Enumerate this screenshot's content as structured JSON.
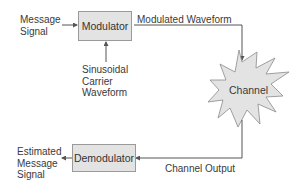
{
  "diagram": {
    "type": "block-diagram",
    "nodes": {
      "modulator": {
        "label": "Modulator"
      },
      "channel": {
        "label": "Channel"
      },
      "demodulator": {
        "label": "Demodulator"
      }
    },
    "labels": {
      "message_signal": "Message\nSignal",
      "carrier": "Sinusoidal\nCarrier\nWaveform",
      "modulated_waveform": "Modulated Waveform",
      "channel_output": "Channel Output",
      "estimated_message": "Estimated\nMessage\nSignal"
    },
    "edges": [
      {
        "from": "Message Signal",
        "to": "Modulator"
      },
      {
        "from": "Sinusoidal Carrier Waveform",
        "to": "Modulator"
      },
      {
        "from": "Modulator",
        "to": "Channel",
        "label": "Modulated Waveform"
      },
      {
        "from": "Channel",
        "to": "Demodulator",
        "label": "Channel Output"
      },
      {
        "from": "Demodulator",
        "to": "Estimated Message Signal"
      }
    ],
    "colors": {
      "box_fill": "#e3e3e3",
      "box_border": "#9a9a9a",
      "line": "#555555"
    }
  }
}
